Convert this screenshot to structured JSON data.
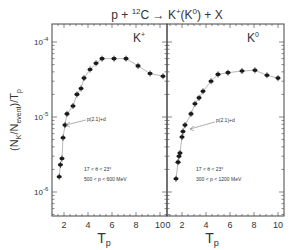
{
  "chart_data": [
    {
      "type": "scatter",
      "panel": "left",
      "title": "p + ¹²C → K⁺(K⁰) + X",
      "label": "K+",
      "label_display": "K⁺",
      "xlabel": "Tp",
      "ylabel": "(Nk/Nevent)/Tp",
      "yscale": "log",
      "ylim": [
        1.7e-07,
        0.00018
      ],
      "xlim": [
        1,
        10.4
      ],
      "xticks": [
        2,
        4,
        6,
        8,
        10
      ],
      "yticks": [
        "10^-4",
        "10^-5",
        "10^-6"
      ],
      "annotations": [
        "p(2.1)+d",
        "17 < θ < 23°",
        "500 < p < 600 MeV"
      ],
      "series": [
        {
          "name": "K+",
          "x": [
            1.6,
            1.7,
            1.83,
            1.92,
            2.08,
            2.25,
            2.75,
            3.08,
            3.42,
            3.67,
            4.17,
            4.67,
            5.17,
            6.17,
            7.17,
            8.17,
            9.17,
            10.25
          ],
          "y": [
            1.6e-06,
            2.3e-06,
            2.8e-06,
            5.3e-06,
            7.8e-06,
            1.1e-05,
            1.4e-05,
            2e-05,
            2.4e-05,
            3.3e-05,
            4.3e-05,
            5.2e-05,
            6e-05,
            6e-05,
            6e-05,
            4.8e-05,
            3.8e-05,
            3.5e-05
          ]
        }
      ]
    },
    {
      "type": "scatter",
      "panel": "right",
      "label": "K0",
      "label_display": "K⁰",
      "xlabel": "Tp",
      "yscale": "log",
      "ylim": [
        1.7e-07,
        0.00018
      ],
      "xlim": [
        0.75,
        10.5
      ],
      "xticks": [
        0,
        2,
        4,
        6,
        8,
        10
      ],
      "annotations": [
        "p(2.1)+d",
        "17 < θ < 23°",
        "300 < p < 1200 MeV"
      ],
      "series": [
        {
          "name": "K0",
          "x": [
            1.5,
            1.67,
            1.75,
            1.83,
            2.0,
            2.08,
            2.25,
            2.75,
            3.08,
            3.42,
            3.75,
            4.42,
            5.0,
            5.83,
            7.0,
            8.08,
            9.08,
            10.0
          ],
          "y": [
            1.5e-06,
            2.5e-06,
            3e-06,
            3.3e-06,
            5.4e-06,
            6.4e-06,
            7.8e-06,
            1.1e-05,
            1.5e-05,
            1.8e-05,
            2.2e-05,
            3e-05,
            3.7e-05,
            3.9e-05,
            4.1e-05,
            4.2e-05,
            3.6e-05,
            3.3e-05
          ]
        }
      ]
    }
  ],
  "figure": {
    "title_parts": {
      "lead": "p + ",
      "sup": "12",
      "tail": "C → K",
      "k_sup1": "+",
      "mid": "(K",
      "k_sup2": "0",
      "end": ") + X"
    },
    "ylabel_parts": {
      "open": "(N",
      "sub_k": "K",
      "slash": "/N",
      "sub_event": "event",
      "close": ")/T",
      "sub_p": "p"
    },
    "xlabel_parts": {
      "main": "T",
      "sub": "p"
    },
    "ytick_base": "10",
    "ytick_exps": [
      "-4",
      "-5",
      "-6"
    ],
    "left_xticks": [
      "2",
      "4",
      "6",
      "8",
      "10"
    ],
    "right_xticks": [
      "0",
      "2",
      "4",
      "6",
      "8",
      "10"
    ],
    "left": {
      "label_main": "K",
      "label_sup": "+",
      "arrow_label": "p(2.1)+d",
      "cut_angle": "17 < θ < 23°",
      "cut_momentum": "500 < p < 600 MeV"
    },
    "right": {
      "label_main": "K",
      "label_sup": "0",
      "arrow_label": "p(2.1)+d",
      "cut_angle": "17 < θ < 23°",
      "cut_momentum": "300 < p < 1200 MeV"
    }
  }
}
